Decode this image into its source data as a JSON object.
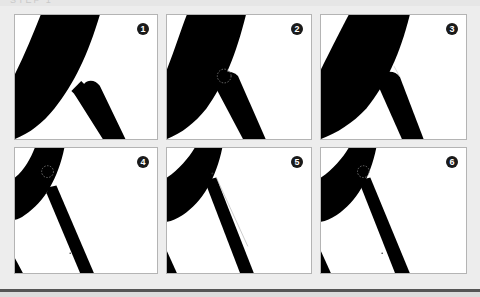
{
  "header": {
    "text": "STEP 1"
  },
  "colors": {
    "background": "#ededed",
    "panel_bg": "#ffffff",
    "panel_border": "#b4b4b4",
    "shape": "#000000",
    "badge_bg": "#1a1a1a",
    "badge_fg": "#ffffff",
    "bottom_rule": "#555555"
  },
  "panels": [
    {
      "number": "1",
      "caption": ""
    },
    {
      "number": "2",
      "caption": ""
    },
    {
      "number": "3",
      "caption": ""
    },
    {
      "number": "4",
      "caption": ""
    },
    {
      "number": "5",
      "caption": ""
    },
    {
      "number": "6",
      "caption": ""
    }
  ]
}
